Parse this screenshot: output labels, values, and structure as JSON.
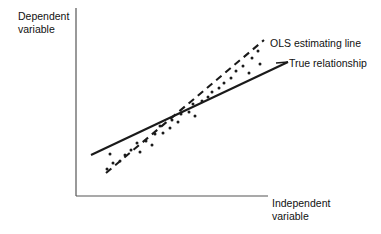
{
  "figure": {
    "width": 381,
    "height": 234,
    "background": "#ffffff",
    "ink_color": "#1a1a1a",
    "axis_color": "#555555"
  },
  "axes": {
    "y_label_line1": "Dependent",
    "y_label_line2": "variable",
    "x_label_line1": "Independent",
    "x_label_line2": "variable",
    "y_axis": {
      "x": 76,
      "y_top": 8,
      "y_bottom": 196
    },
    "x_axis": {
      "y": 196,
      "x_left": 76,
      "x_right": 268
    }
  },
  "annotations": {
    "ols_label": "OLS estimating line",
    "true_label": "True relationship",
    "ols_leader": {
      "x1": 258,
      "y1": 48,
      "x2": 268,
      "y2": 41
    },
    "true_leader": {
      "x1": 288,
      "y1": 62,
      "x2": 276,
      "y2": 63
    }
  },
  "chart_data": {
    "type": "scatter",
    "title": "",
    "xlabel": "Independent variable",
    "ylabel": "Dependent variable",
    "grid": false,
    "legend_position": "inline-annotations",
    "axis_ticks": {
      "x": [],
      "y": []
    },
    "xlim": [
      76,
      300
    ],
    "ylim": [
      196,
      30
    ],
    "points": [
      {
        "x": 107,
        "y": 169
      },
      {
        "x": 113,
        "y": 163
      },
      {
        "x": 120,
        "y": 161
      },
      {
        "x": 110,
        "y": 154
      },
      {
        "x": 125,
        "y": 155
      },
      {
        "x": 131,
        "y": 150
      },
      {
        "x": 140,
        "y": 152
      },
      {
        "x": 137,
        "y": 143
      },
      {
        "x": 146,
        "y": 141
      },
      {
        "x": 152,
        "y": 145
      },
      {
        "x": 155,
        "y": 134
      },
      {
        "x": 163,
        "y": 133
      },
      {
        "x": 160,
        "y": 126
      },
      {
        "x": 170,
        "y": 128
      },
      {
        "x": 172,
        "y": 120
      },
      {
        "x": 178,
        "y": 122
      },
      {
        "x": 181,
        "y": 114
      },
      {
        "x": 189,
        "y": 112
      },
      {
        "x": 195,
        "y": 116
      },
      {
        "x": 193,
        "y": 104
      },
      {
        "x": 202,
        "y": 101
      },
      {
        "x": 208,
        "y": 97
      },
      {
        "x": 212,
        "y": 92
      },
      {
        "x": 219,
        "y": 88
      },
      {
        "x": 224,
        "y": 83
      },
      {
        "x": 231,
        "y": 78
      },
      {
        "x": 236,
        "y": 71
      },
      {
        "x": 243,
        "y": 66
      },
      {
        "x": 249,
        "y": 73
      },
      {
        "x": 252,
        "y": 58
      },
      {
        "x": 258,
        "y": 51
      },
      {
        "x": 260,
        "y": 64
      }
    ],
    "series": [
      {
        "name": "True relationship",
        "style": "solid",
        "x": [
          91,
          288
        ],
        "y": [
          155,
          62
        ]
      },
      {
        "name": "OLS estimating line",
        "style": "dashed",
        "x": [
          106,
          264
        ],
        "y": [
          173,
          40
        ]
      }
    ]
  }
}
